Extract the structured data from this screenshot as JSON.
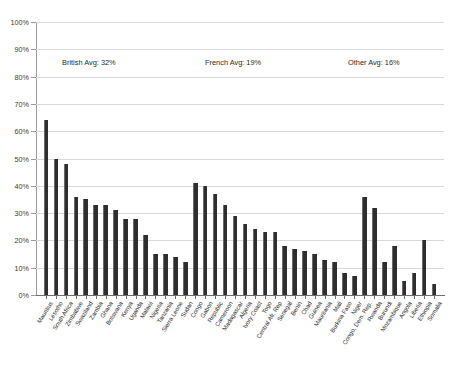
{
  "chart_data": {
    "type": "bar",
    "title": "",
    "subtitle": "",
    "xlabel": "",
    "ylabel": "",
    "ylim": [
      0,
      100
    ],
    "grid": true,
    "legend": "none",
    "series_name": "Percent",
    "ytick_labels": [
      "100%",
      "90%",
      "80%",
      "70%",
      "60%",
      "50%",
      "40%",
      "30%",
      "20%",
      "10%",
      "0%"
    ],
    "ytick_values": [
      100,
      90,
      80,
      70,
      60,
      50,
      40,
      30,
      20,
      10,
      0
    ],
    "bar_color": "#2e2e2e",
    "categories": [
      "Mauritius",
      "Lesotho",
      "South Africa",
      "Zimbabwe",
      "Swaziland",
      "Zambia",
      "Ghana",
      "Botswana",
      "Kenya",
      "Uganda",
      "Malawi",
      "Nigeria",
      "Tanzania",
      "Sierra Leone",
      "Sudan",
      "Congo",
      "Gabon",
      "Republic",
      "Cameroon",
      "Madagascar",
      "Algeria",
      "Ivory Coast",
      "Togo",
      "Central Afr. Rep",
      "Senegal",
      "Benin",
      "Chad",
      "Guinea",
      "Mauritania",
      "Mali",
      "Burkina Faso",
      "Niger",
      "Congo, Dem. Rep.",
      "Rwanda",
      "Burundi",
      "Mozambique",
      "Angola",
      "Liberia",
      "Ethiopia",
      "Somalia"
    ],
    "values": [
      64,
      50,
      48,
      36,
      35,
      33,
      33,
      31,
      28,
      28,
      22,
      15,
      15,
      14,
      12,
      41,
      40,
      37,
      33,
      29,
      26,
      24,
      23,
      23,
      18,
      17,
      16,
      15,
      13,
      12,
      8,
      7,
      36,
      32,
      12,
      18,
      5,
      8,
      20,
      4
    ],
    "groups": [
      {
        "name": "British",
        "start_index": 0,
        "count": 15
      },
      {
        "name": "French",
        "start_index": 15,
        "count": 17
      },
      {
        "name": "Other",
        "start_index": 32,
        "count": 8
      }
    ]
  },
  "annotations": [
    {
      "id": "british-avg",
      "text": "British Avg: 32%",
      "x_px": 62,
      "y_px": 58
    },
    {
      "id": "french-avg",
      "text": "French Avg: 19%",
      "x_px": 205,
      "y_px": 58
    },
    {
      "id": "other-avg",
      "text": "Other Avg: 16%",
      "x_px": 348,
      "y_px": 58
    }
  ]
}
